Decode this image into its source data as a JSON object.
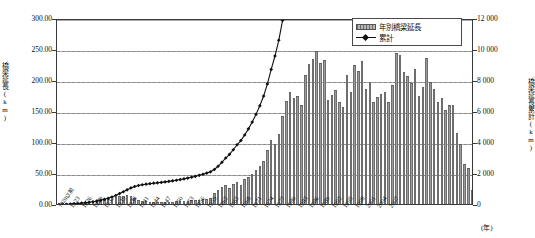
{
  "chart_data": {
    "type": "bar",
    "title": "",
    "xlabel": "(年)",
    "ylabel": "橋梁延長(km)",
    "y2label": "橋梁延長累計(km)",
    "ylim": [
      0,
      300
    ],
    "y2lim": [
      0,
      12000
    ],
    "ytick_labels": [
      "300.00",
      "250.00",
      "200.00",
      "150.00",
      "100.00",
      "50.00",
      "0.00"
    ],
    "y2tick_labels": [
      "12 000",
      "10 000",
      "8 000",
      "6 000",
      "4 000",
      "2 000",
      "0"
    ],
    "grid": true,
    "legend_position": "top-right",
    "legend": [
      {
        "name": "年別橋梁延長",
        "kind": "bar"
      },
      {
        "name": "累計",
        "kind": "line"
      }
    ],
    "series": [
      {
        "name": "年別橋梁延長",
        "kind": "bar",
        "unit": "km",
        "values": [
          1.2,
          1.4,
          1.6,
          1.5,
          1.8,
          2.0,
          2.4,
          2.6,
          3.0,
          3.4,
          4.6,
          6.2,
          6.6,
          7.4,
          8.2,
          11.0,
          13.6,
          13.2,
          14.0,
          13.6,
          10.2,
          7.0,
          5.0,
          4.2,
          3.6,
          3.2,
          2.8,
          3.0,
          3.4,
          3.6,
          4.0,
          4.4,
          4.8,
          5.2,
          5.6,
          6.0,
          6.4,
          7.0,
          7.6,
          8.2,
          9.0,
          17.0,
          23.0,
          28.0,
          31.0,
          26.0,
          33.0,
          36.0,
          30.0,
          40.0,
          44.0,
          49.0,
          55.0,
          61.0,
          70.0,
          87.0,
          104.0,
          96.0,
          113.0,
          142.0,
          166.0,
          181.0,
          171.0,
          174.0,
          160.0,
          208.0,
          226.0,
          234.0,
          247.0,
          227.0,
          232.0,
          168.0,
          176.0,
          184.0,
          164.0,
          157.0,
          208.0,
          180.0,
          225.0,
          214.0,
          231.0,
          185.0,
          197.0,
          165.0,
          173.0,
          178.0,
          180.0,
          164.0,
          192.0,
          244.0,
          240.0,
          213.0,
          206.0,
          195.0,
          218.0,
          175.0,
          189.0,
          235.0,
          197.0,
          186.0,
          165.0,
          171.0,
          152.0,
          160.0,
          160.0,
          114.0,
          96.0,
          65.0,
          58.0,
          22.0
        ]
      },
      {
        "name": "累計",
        "kind": "line",
        "unit": "km",
        "values": [
          60,
          80,
          100,
          118,
          140,
          162,
          188,
          212,
          240,
          272,
          316,
          372,
          432,
          500,
          576,
          676,
          800,
          920,
          1046,
          1168,
          1260,
          1324,
          1370,
          1408,
          1440,
          1470,
          1496,
          1522,
          1554,
          1586,
          1622,
          1662,
          1706,
          1752,
          1804,
          1858,
          1916,
          1980,
          2048,
          2122,
          2204,
          2356,
          2564,
          2816,
          3096,
          3332,
          3628,
          3952,
          4222,
          4580,
          4976,
          5416,
          5912,
          6464,
          7092,
          7876,
          8812,
          9676,
          10692,
          11970,
          13464,
          15092,
          16632,
          18198,
          19638,
          21510,
          23544,
          25650,
          27872,
          29916,
          32004,
          33516,
          35100,
          36756,
          38232,
          39646,
          41518,
          43138,
          45164,
          47090,
          49168,
          50834,
          52606,
          54092,
          55650,
          57252,
          58872,
          60348,
          62076,
          64272,
          66432,
          68349,
          70203,
          71958,
          73920,
          75495,
          77196,
          79311,
          81084,
          82758,
          84243,
          85782,
          87150,
          88590,
          90030,
          91056,
          91920,
          92505,
          93027,
          93225
        ],
        "note": "plotted against right axis, 0-12 000 scale"
      }
    ],
    "x_start_label": "1920以前",
    "x_tick_labels": [
      "1920以前",
      "1923",
      "1926",
      "1929",
      "1932",
      "1935",
      "1938",
      "1941",
      "1944",
      "1947",
      "1950",
      "1953",
      "1956",
      "1959",
      "1962",
      "1965",
      "1968",
      "1971",
      "1974",
      "1977",
      "1980",
      "1983",
      "1986",
      "1989",
      "1992",
      "1995",
      "1998",
      "2001",
      "2004",
      "2007"
    ],
    "x_tick_interval_years": 3,
    "x_category_count": 110
  }
}
